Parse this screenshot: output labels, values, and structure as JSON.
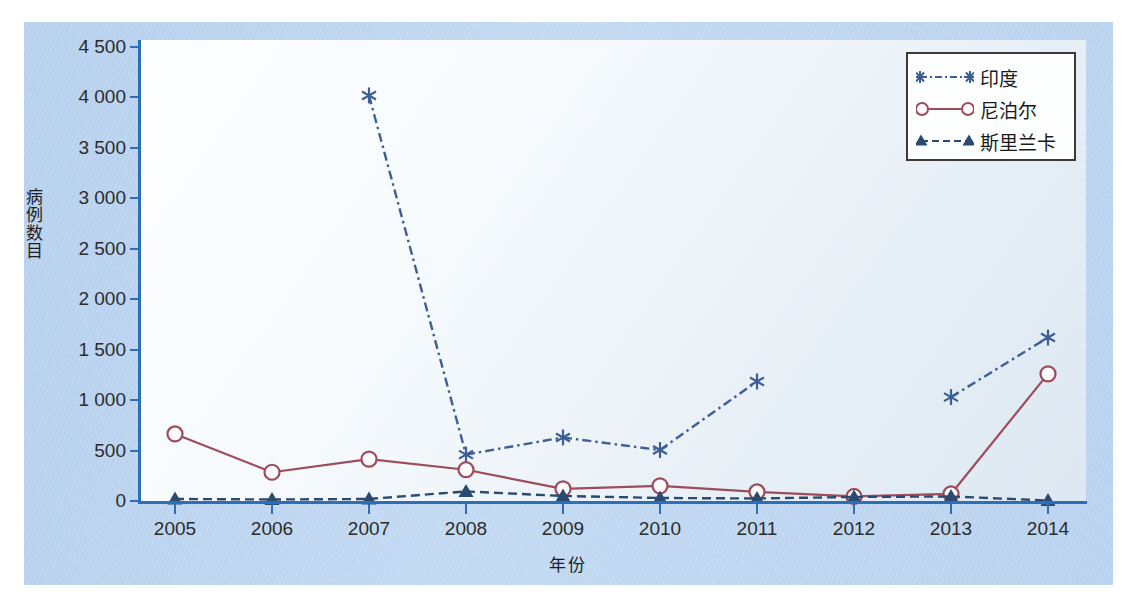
{
  "chart_data": {
    "type": "line",
    "title": "",
    "xlabel": "年份",
    "ylabel": "病例数目",
    "x": [
      2005,
      2006,
      2007,
      2008,
      2009,
      2010,
      2011,
      2012,
      2013,
      2014
    ],
    "xticklabels": [
      "2005",
      "2006",
      "2007",
      "2008",
      "2009",
      "2010",
      "2011",
      "2012",
      "2013",
      "2014"
    ],
    "yticks": [
      0,
      500,
      1000,
      1500,
      2000,
      2500,
      3000,
      3500,
      4000,
      4500
    ],
    "yticklabels": [
      "0",
      "500",
      "1 000",
      "1 500",
      "2 000",
      "2 500",
      "3 000",
      "3 500",
      "4 000",
      "4 500"
    ],
    "ylim": [
      0,
      4500
    ],
    "xlim": [
      2005,
      2014
    ],
    "grid": false,
    "legend_position": "top-right",
    "series": [
      {
        "name": "印度",
        "color": "#3d5f95",
        "marker": "asterisk",
        "linestyle": "dashdot",
        "x": [
          2007,
          2008,
          2009,
          2010,
          2011,
          2013,
          2014
        ],
        "values": [
          4020,
          460,
          630,
          505,
          1185,
          1030,
          1620
        ]
      },
      {
        "name": "尼泊尔",
        "color": "#9e4b5c",
        "marker": "circle",
        "linestyle": "solid",
        "x": [
          2005,
          2006,
          2007,
          2008,
          2009,
          2010,
          2011,
          2012,
          2013,
          2014
        ],
        "values": [
          665,
          285,
          415,
          310,
          120,
          150,
          90,
          45,
          70,
          1260
        ]
      },
      {
        "name": "斯里兰卡",
        "color": "#2b4a6f",
        "marker": "triangle",
        "linestyle": "dashed",
        "x": [
          2005,
          2006,
          2007,
          2008,
          2009,
          2010,
          2011,
          2012,
          2013,
          2014
        ],
        "values": [
          20,
          15,
          20,
          95,
          50,
          30,
          25,
          40,
          45,
          5
        ]
      }
    ]
  },
  "legend": {
    "items": [
      {
        "label": "印度"
      },
      {
        "label": "尼泊尔"
      },
      {
        "label": "斯里兰卡"
      }
    ]
  },
  "axes": {
    "y_title": "病例数目",
    "x_title": "年份"
  },
  "colors": {
    "india": "#3d5f95",
    "nepal": "#9e4b5c",
    "srilanka": "#2b4a6f",
    "axis": "#2d6fb7",
    "panel": "#b9d2ef"
  }
}
